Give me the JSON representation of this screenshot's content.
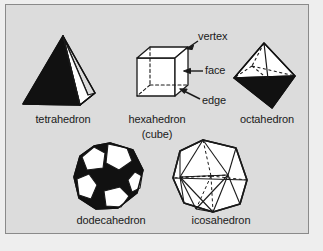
{
  "figure": {
    "background_color": "#dcdcdc",
    "outer_color": "#eeeeee",
    "border_color": "#8a8a8a",
    "ink_color": "#1a1a1a",
    "fill_dark": "#111111",
    "fill_light": "#ffffff"
  },
  "solids": [
    {
      "name": "tetrahedron",
      "label": "tetrahedron",
      "faces": 4,
      "shading": "dark-left-white-right"
    },
    {
      "name": "hexahedron",
      "label": "hexahedron",
      "label_line2": "(cube)",
      "faces": 6,
      "shading": "wireframe-dashed-hidden"
    },
    {
      "name": "octahedron",
      "label": "octahedron",
      "faces": 8,
      "shading": "white-top-dark-bottom"
    },
    {
      "name": "dodecahedron",
      "label": "dodecahedron",
      "faces": 12,
      "shading": "alternating-black-white-pentagons"
    },
    {
      "name": "icosahedron",
      "label": "icosahedron",
      "faces": 20,
      "shading": "white-wireframe-dashed-hidden"
    }
  ],
  "callouts": [
    {
      "name": "vertex",
      "label": "vertex"
    },
    {
      "name": "face",
      "label": "face"
    },
    {
      "name": "edge",
      "label": "edge"
    }
  ]
}
